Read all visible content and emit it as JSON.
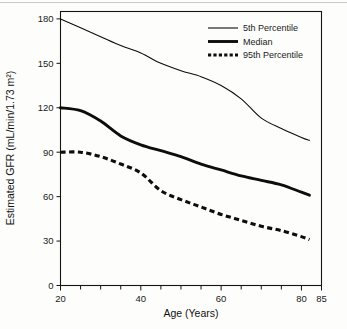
{
  "chart_data": {
    "type": "line",
    "title": "",
    "xlabel": "Age (Years)",
    "ylabel": "Estimated GFR (mL/min/1.73 m²)",
    "xlim": [
      20,
      85
    ],
    "ylim": [
      0,
      185
    ],
    "grid": false,
    "legend_position": "top-right",
    "x_ticks_major": [
      20,
      40,
      60,
      80,
      85
    ],
    "x_tick_labels": [
      "20",
      "40",
      "60",
      "80",
      "85"
    ],
    "x_ticks_minor": [
      25,
      30,
      35,
      45,
      50,
      55,
      65,
      70,
      75
    ],
    "y_ticks": [
      0,
      30,
      60,
      90,
      120,
      150,
      180
    ],
    "y_tick_labels": [
      "0",
      "30",
      "60",
      "90",
      "120",
      "150",
      "180"
    ],
    "x": [
      20,
      25,
      30,
      35,
      40,
      45,
      50,
      55,
      60,
      65,
      70,
      75,
      80,
      82
    ],
    "series": [
      {
        "name": "5th Percentile",
        "style": "thin-solid",
        "values": [
          180,
          174,
          168,
          162,
          157,
          150,
          145,
          141,
          135,
          126,
          113,
          106,
          100,
          98
        ]
      },
      {
        "name": "Median",
        "style": "thick-solid",
        "values": [
          120,
          118,
          111,
          101,
          95,
          91,
          87,
          82,
          78,
          74,
          71,
          68,
          63,
          61
        ]
      },
      {
        "name": "95th Percentile",
        "style": "thick-dashed",
        "values": [
          90,
          90,
          87,
          82,
          76,
          64,
          58,
          53,
          48,
          44,
          40,
          37,
          33,
          31
        ]
      }
    ]
  },
  "legend": {
    "entries": [
      {
        "label": "5th Percentile"
      },
      {
        "label": "Median"
      },
      {
        "label": "95th Percentile"
      }
    ]
  }
}
